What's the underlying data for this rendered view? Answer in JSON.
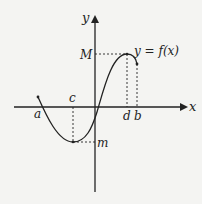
{
  "diagram": {
    "type": "function-graph",
    "curve_label": "y = f(x)",
    "axes": {
      "x_label": "x",
      "y_label": "y"
    },
    "x_ticks": {
      "a": "a",
      "c": "c",
      "d": "d",
      "b": "b"
    },
    "y_ticks": {
      "M": "M",
      "m": "m"
    },
    "colors": {
      "background": "#f4f4f2",
      "ink": "#222222"
    }
  }
}
